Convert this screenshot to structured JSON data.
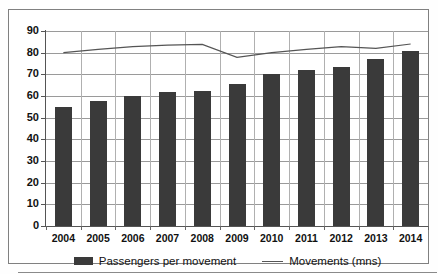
{
  "chart_data": {
    "type": "bar",
    "title": "",
    "subtitle": "",
    "xlabel": "",
    "ylabel": "",
    "ylim": [
      0,
      90
    ],
    "ytick_step": 10,
    "yticks": [
      90,
      80,
      70,
      60,
      50,
      40,
      30,
      20,
      10,
      0
    ],
    "ytick_labels": [
      "90",
      "80",
      "70",
      "60",
      "50",
      "40",
      "30",
      "20",
      "10",
      "0"
    ],
    "categories": [
      "2004",
      "2005",
      "2006",
      "2007",
      "2008",
      "2009",
      "2010",
      "2011",
      "2012",
      "2013",
      "2014"
    ],
    "grid": true,
    "grid_axis": "both",
    "legend_position": "bottom",
    "series": [
      {
        "name": "Passengers per movement",
        "type": "bar",
        "color": "#3a3a3a",
        "values": [
          55.0,
          57.5,
          60.0,
          62.0,
          62.5,
          65.5,
          70.0,
          71.8,
          73.5,
          77.3,
          80.8
        ]
      },
      {
        "name": "Movements (mns)",
        "type": "line",
        "color": "#555555",
        "values": [
          80.0,
          81.5,
          82.8,
          83.5,
          83.8,
          77.8,
          80.0,
          81.5,
          82.8,
          82.0,
          84.0
        ]
      }
    ]
  },
  "legend": {
    "entries": [
      {
        "label": "Passengers per movement",
        "marker": "bar-swatch"
      },
      {
        "label": "Movements (mns)",
        "marker": "line-swatch"
      }
    ]
  },
  "colors": {
    "bar": "#3a3a3a",
    "line": "#555555",
    "gridline": "#9a9a9a",
    "axis": "#555555",
    "frame": "#808080",
    "background": "#ffffff",
    "text": "#111111"
  }
}
